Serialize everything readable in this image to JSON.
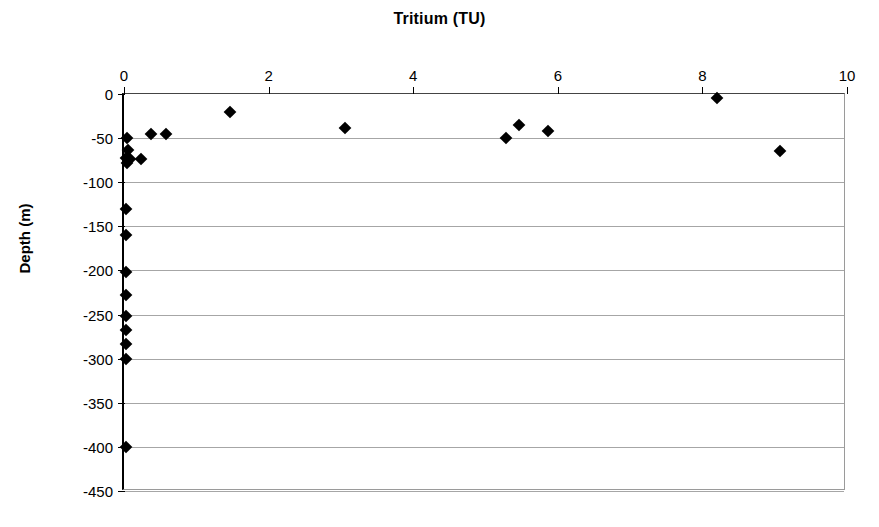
{
  "chart_data": {
    "type": "scatter",
    "title": "Tritium (TU)",
    "xlabel": "Tritium (TU)",
    "ylabel": "Depth (m)",
    "xlim": [
      0,
      10
    ],
    "ylim": [
      -450,
      0
    ],
    "xticks": [
      0,
      2,
      4,
      6,
      8,
      10
    ],
    "yticks": [
      0,
      -50,
      -100,
      -150,
      -200,
      -250,
      -300,
      -350,
      -400,
      -450
    ],
    "xticklabels": [
      "0",
      "2",
      "4",
      "6",
      "8",
      "10"
    ],
    "yticklabels": [
      "0",
      "-50",
      "-100",
      "-150",
      "-200",
      "-250",
      "-300",
      "-350",
      "-400",
      "-450"
    ],
    "grid": "horizontal",
    "legend": null,
    "marker": "filled-diamond",
    "marker_color": "#000000",
    "series": [
      {
        "name": "Tritium vs Depth",
        "points": [
          {
            "x": 8.2,
            "y": -5
          },
          {
            "x": 1.47,
            "y": -20
          },
          {
            "x": 5.47,
            "y": -35
          },
          {
            "x": 3.06,
            "y": -39
          },
          {
            "x": 5.87,
            "y": -42
          },
          {
            "x": 0.37,
            "y": -45
          },
          {
            "x": 0.58,
            "y": -45
          },
          {
            "x": 0.04,
            "y": -50
          },
          {
            "x": 5.28,
            "y": -50
          },
          {
            "x": 0.05,
            "y": -63
          },
          {
            "x": 9.07,
            "y": -65
          },
          {
            "x": 0.03,
            "y": -73
          },
          {
            "x": 0.08,
            "y": -74
          },
          {
            "x": 0.23,
            "y": -74
          },
          {
            "x": 0.04,
            "y": -78
          },
          {
            "x": 0.03,
            "y": -130
          },
          {
            "x": 0.03,
            "y": -160
          },
          {
            "x": 0.03,
            "y": -202
          },
          {
            "x": 0.03,
            "y": -228
          },
          {
            "x": 0.03,
            "y": -252
          },
          {
            "x": 0.03,
            "y": -267
          },
          {
            "x": 0.03,
            "y": -283
          },
          {
            "x": 0.03,
            "y": -300
          },
          {
            "x": 0.03,
            "y": -400
          }
        ]
      }
    ]
  }
}
